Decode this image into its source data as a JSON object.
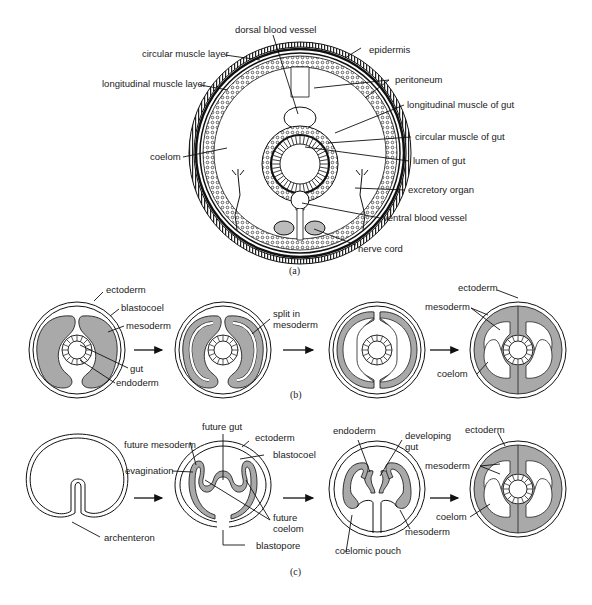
{
  "panel_a": {
    "caption": "(a)",
    "labels": {
      "dorsal_blood_vessel": "dorsal blood vessel",
      "circular_muscle_layer": "circular muscle layer",
      "epidermis": "epidermis",
      "longitudinal_muscle_layer": "longitudinal muscle layer",
      "peritoneum": "peritoneum",
      "longitudinal_muscle_of_gut": "longitudinal muscle of gut",
      "circular_muscle_of_gut": "circular muscle of gut",
      "coelom": "coelom",
      "lumen_of_gut": "lumen of gut",
      "excretory_organ": "excretory organ",
      "ventral_blood_vessel": "ventral blood vessel",
      "nerve_cord": "nerve cord"
    }
  },
  "panel_b": {
    "caption": "(b)",
    "labels": {
      "ectoderm": "ectoderm",
      "blastocoel": "blastocoel",
      "mesoderm": "mesoderm",
      "gut": "gut",
      "endoderm": "endoderm",
      "split_in": "split in",
      "split_mesoderm": "mesoderm",
      "final_ectoderm": "ectoderm",
      "final_mesoderm": "mesoderm",
      "final_coelom": "coelom"
    }
  },
  "panel_c": {
    "caption": "(c)",
    "labels": {
      "archenteron": "archenteron",
      "future_gut": "future gut",
      "ectoderm": "ectoderm",
      "future_mesoderm": "future mesoderm",
      "blastocoel": "blastocoel",
      "evagination": "evagination",
      "future": "future",
      "coelom": "coelom",
      "blastopore": "blastopore",
      "endoderm": "endoderm",
      "developing": "developing",
      "gut": "gut",
      "mesoderm": "mesoderm",
      "coelomic_pouch": "coelomic pouch",
      "final_ectoderm": "ectoderm",
      "final_mesoderm": "mesoderm",
      "final_coelom": "coelom"
    }
  },
  "colors": {
    "mesoderm_fill": "#a9a9a9",
    "line": "#111111"
  }
}
